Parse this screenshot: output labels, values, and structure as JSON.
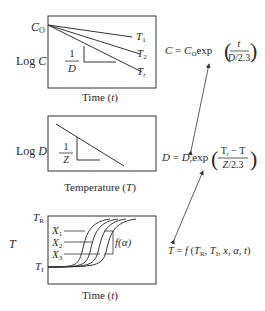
{
  "panel1": {
    "ylabel": "Log C",
    "xlabel": "Time (t)",
    "origin_label": "C",
    "origin_sub": "O",
    "curves": [
      {
        "label": "T",
        "sub": "1"
      },
      {
        "label": "T",
        "sub": "2"
      },
      {
        "label": "T",
        "sub": "r"
      }
    ],
    "slope_num": "1",
    "slope_den": "D"
  },
  "panel2": {
    "ylabel": "Log D",
    "xlabel": "Temperature (T)",
    "slope_num": "1",
    "slope_den": "Z"
  },
  "panel3": {
    "ylabel": "T",
    "xlabel": "Time (t)",
    "top_label": "T",
    "top_sub": "R",
    "bottom_label": "T",
    "bottom_sub": "I",
    "curves": [
      {
        "label": "X",
        "sub": "1"
      },
      {
        "label": "X",
        "sub": "2"
      },
      {
        "label": "X",
        "sub": "3"
      }
    ],
    "func_label": "f(α)"
  },
  "equations": {
    "eq1": {
      "lhs": "C = C",
      "sub": "O",
      "fn": "exp",
      "num": "t",
      "den": "D/2.3"
    },
    "eq2": {
      "lhs": "D = D",
      "sub": "r",
      "fn": "exp",
      "num": "T",
      "num_sub": "r",
      "num_rest": " − T",
      "den": "Z/2.3"
    },
    "eq3": {
      "text": "T = f (T",
      "s1": "R",
      "mid": ", T",
      "s2": "I",
      "rest": ", x, α, t)"
    }
  }
}
